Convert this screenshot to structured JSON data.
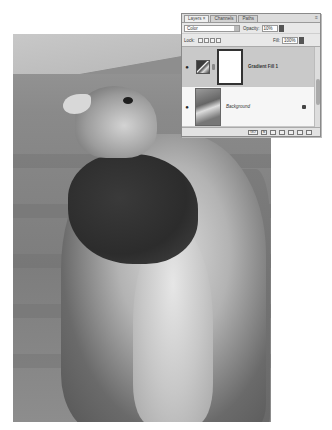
{
  "photo": {
    "subject": "hawk-photo"
  },
  "panel": {
    "tabs": [
      {
        "label": "Layers ×",
        "active": true
      },
      {
        "label": "Channels",
        "active": false
      },
      {
        "label": "Paths",
        "active": false
      }
    ],
    "menu_icon": "≡",
    "blend_mode": "Color",
    "opacity_label": "Opacity:",
    "opacity_value": "10%",
    "lock_label": "Lock:",
    "fill_label": "Fill:",
    "fill_value": "100%",
    "layers": [
      {
        "name": "Gradient Fill 1",
        "visible": true,
        "selected": true
      },
      {
        "name": "Background",
        "visible": true,
        "selected": false,
        "locked": true
      }
    ],
    "footer_link": "GO",
    "footer_icons": [
      "link-layers-icon",
      "fx-icon",
      "mask-icon",
      "adjustment-icon",
      "group-icon",
      "new-layer-icon",
      "trash-icon"
    ]
  }
}
